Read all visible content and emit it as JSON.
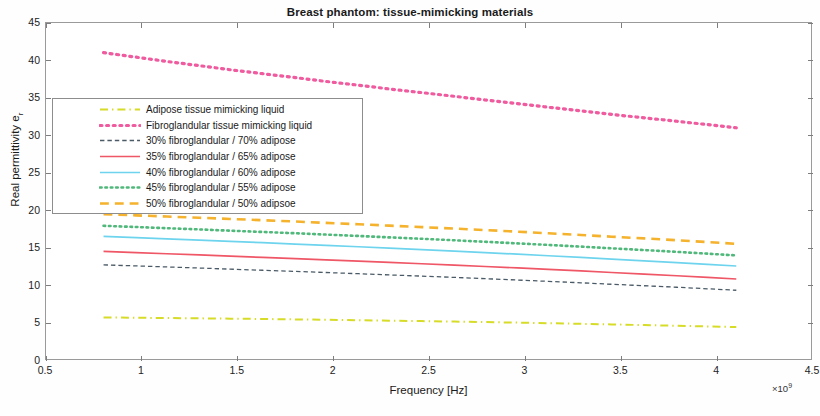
{
  "chart_data": {
    "type": "line",
    "title": "Breast phantom: tissue-mimicking materials",
    "xlabel": "Frequency [Hz]",
    "ylabel": "Real permittivity e",
    "ylabel_subscript": "r",
    "x_exponent_prefix": "×10",
    "x_exponent_power": "9",
    "xlim": [
      0.5,
      4.5
    ],
    "ylim": [
      0,
      45
    ],
    "xticks": [
      "0.5",
      "1",
      "1.5",
      "2",
      "2.5",
      "3",
      "3.5",
      "4",
      "4.5"
    ],
    "xtick_values": [
      0.5,
      1,
      1.5,
      2,
      2.5,
      3,
      3.5,
      4,
      4.5
    ],
    "yticks": [
      "0",
      "5",
      "10",
      "15",
      "20",
      "25",
      "30",
      "35",
      "40",
      "45"
    ],
    "ytick_values": [
      0,
      5,
      10,
      15,
      20,
      25,
      30,
      35,
      40,
      45
    ],
    "grid": false,
    "legend_position": "upper-left-inside",
    "x": [
      0.8,
      0.97,
      1.13,
      1.3,
      1.46,
      1.63,
      1.8,
      1.96,
      2.13,
      2.29,
      2.46,
      2.63,
      2.79,
      2.96,
      3.12,
      3.29,
      3.45,
      3.62,
      3.79,
      3.95,
      4.1
    ],
    "series": [
      {
        "name": "Adipose tissue mimicking liquid",
        "color": "#d6dc28",
        "style": "dashdot",
        "width": 2.0,
        "values": [
          5.8,
          5.76,
          5.72,
          5.68,
          5.64,
          5.59,
          5.54,
          5.49,
          5.43,
          5.37,
          5.31,
          5.25,
          5.18,
          5.11,
          5.03,
          4.95,
          4.87,
          4.78,
          4.69,
          4.6,
          4.52
        ]
      },
      {
        "name": "Fibroglandular tissue mimicking liquid",
        "color": "#f05a9e",
        "style": "dotted",
        "width": 3.2,
        "values": [
          41.05,
          40.45,
          39.88,
          39.32,
          38.78,
          38.25,
          37.73,
          37.22,
          36.72,
          36.22,
          35.73,
          35.24,
          34.75,
          34.26,
          33.78,
          33.3,
          32.83,
          32.37,
          31.92,
          31.47,
          31.05
        ]
      },
      {
        "name": "30% fibroglandular / 70% adipose",
        "color": "#4a5a66",
        "style": "dashed",
        "width": 1.3,
        "values": [
          12.8,
          12.66,
          12.52,
          12.38,
          12.23,
          12.08,
          11.93,
          11.78,
          11.62,
          11.46,
          11.3,
          11.13,
          10.96,
          10.78,
          10.6,
          10.41,
          10.22,
          10.02,
          9.82,
          9.61,
          9.42
        ]
      },
      {
        "name": "35% fibroglandular / 65% adipose",
        "color": "#ef5666",
        "style": "solid",
        "width": 1.7,
        "values": [
          14.6,
          14.44,
          14.28,
          14.12,
          13.96,
          13.8,
          13.64,
          13.47,
          13.3,
          13.13,
          12.95,
          12.77,
          12.58,
          12.39,
          12.19,
          11.99,
          11.78,
          11.57,
          11.35,
          11.13,
          10.92
        ]
      },
      {
        "name": "40% fibroglandular / 60% adipose",
        "color": "#6ed4ee",
        "style": "solid",
        "width": 1.7,
        "values": [
          16.6,
          16.43,
          16.26,
          16.09,
          15.92,
          15.75,
          15.57,
          15.39,
          15.21,
          15.02,
          14.83,
          14.63,
          14.43,
          14.22,
          14.01,
          13.79,
          13.57,
          13.34,
          13.11,
          12.87,
          12.65
        ]
      },
      {
        "name": "45% fibroglandular / 55% adipose",
        "color": "#4fb87a",
        "style": "dotted",
        "width": 2.6,
        "values": [
          18.0,
          17.84,
          17.68,
          17.52,
          17.35,
          17.18,
          17.01,
          16.83,
          16.65,
          16.46,
          16.27,
          16.07,
          15.87,
          15.66,
          15.45,
          15.23,
          15.0,
          14.77,
          14.53,
          14.29,
          14.06
        ]
      },
      {
        "name": "50% fibroglandular / 50% adipsoe",
        "color": "#f5b22d",
        "style": "dashed",
        "width": 2.6,
        "values": [
          19.55,
          19.39,
          19.23,
          19.07,
          18.91,
          18.74,
          18.57,
          18.39,
          18.21,
          18.02,
          17.83,
          17.63,
          17.43,
          17.22,
          17.0,
          16.78,
          16.55,
          16.32,
          16.08,
          15.83,
          15.6
        ]
      }
    ]
  }
}
